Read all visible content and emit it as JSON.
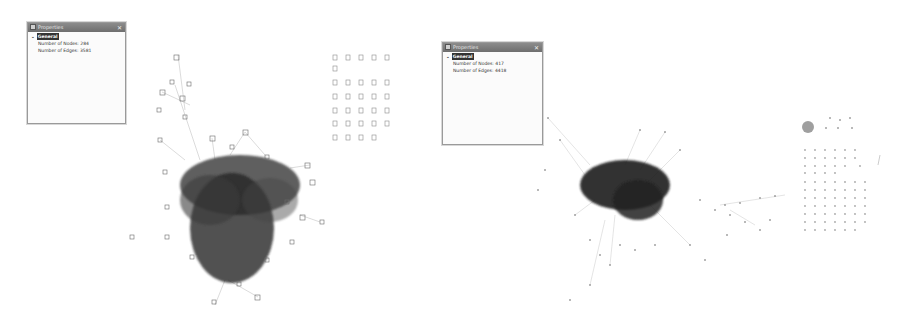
{
  "panels": [
    {
      "id": "left",
      "title": "Properties",
      "close": "✕",
      "section": "General",
      "rows": [
        {
          "label": "Number of Nodes:",
          "value": "284"
        },
        {
          "label": "Number of Edges:",
          "value": "3581"
        }
      ]
    },
    {
      "id": "right",
      "title": "Properties",
      "close": "✕",
      "section": "General",
      "rows": [
        {
          "label": "Number of Nodes:",
          "value": "417"
        },
        {
          "label": "Number of Edges:",
          "value": "4418"
        }
      ]
    }
  ],
  "graphs": [
    {
      "name": "left-network-graph",
      "cluster_center": [
        228,
        200
      ],
      "isolated_grid": {
        "x": 335,
        "y": 57,
        "cols": 5,
        "rows": 7
      }
    },
    {
      "name": "right-network-graph",
      "cluster_center": [
        622,
        185
      ],
      "isolated_grid": {
        "x": 805,
        "y": 148,
        "cols": 8,
        "rows": 10
      }
    }
  ],
  "colors": {
    "node": "#555555",
    "edge": "#888888",
    "dense": "#2a2a2a"
  }
}
